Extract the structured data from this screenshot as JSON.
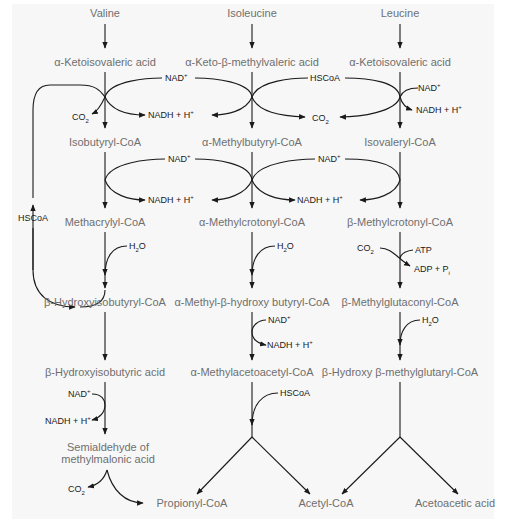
{
  "colors": {
    "metabolite_text": "#6f6f6f",
    "cofactor_text": "#1a1a1a",
    "lines": "#1a1a1a",
    "background": "#f7f7f7"
  },
  "columns": {
    "valine": {
      "amino_acid": "Valine",
      "keto_acid": "α-Ketoisovaleric acid",
      "acyl_coa": "Isobutyryl-CoA",
      "enoyl_coa": "Methacrylyl-CoA",
      "hydroxy_coa": "β-Hydroxyisobutyryl-CoA",
      "hydroxy_acid": "β-Hydroxyisobutyric acid",
      "semialdehyde_line1": "Semialdehyde of",
      "semialdehyde_line2": "methylmalonic acid",
      "product": "Propionyl-CoA"
    },
    "isoleucine": {
      "amino_acid": "Isoleucine",
      "keto_acid": "α-Keto-β-methylvaleric acid",
      "acyl_coa": "α-Methylbutyryl-CoA",
      "enoyl_coa": "α-Methylcrotonyl-CoA",
      "hydroxy_coa": "α-Methyl-β-hydroxy butyryl-CoA",
      "keto_coa": "α-Methylacetoacetyl-CoA",
      "product": "Acetyl-CoA"
    },
    "leucine": {
      "amino_acid": "Leucine",
      "keto_acid": "α-Ketoisovaleric acid",
      "acyl_coa": "Isovaleryl-CoA",
      "enoyl_coa": "β-Methylcrotonyl-CoA",
      "carboxy_coa": "β-Methylglutaconyl-CoA",
      "hmg_coa": "β-Hydroxy β-methylglutaryl-CoA",
      "product": "Acetoacetic acid"
    }
  },
  "cofactors": {
    "nad": "NAD",
    "nad_sup": "+",
    "nadh": "NADH + H",
    "nadh_sup": "+",
    "co2": "CO",
    "co2_sub": "2",
    "hscoa": "HSCoA",
    "h2o_h": "H",
    "h2o_sub": "2",
    "h2o_o": "O",
    "atp": "ATP",
    "adp": "ADP + P",
    "adp_sub": "i"
  },
  "side_loop_label": "HSCoA",
  "icons": [
    "arrow-down-icon",
    "curved-arrow-icon",
    "branch-arrow-icon"
  ]
}
